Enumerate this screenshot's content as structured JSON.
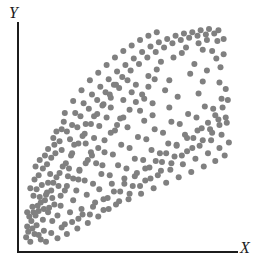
{
  "figure": {
    "width": 262,
    "height": 267,
    "background_color": "#ffffff"
  },
  "axes": {
    "y_label": "Y",
    "x_label": "X",
    "axis_color": "#1c1c1c",
    "origin_px": [
      17,
      252
    ],
    "y_axis_top_px": 22,
    "x_axis_right_px": 238
  },
  "chart_data": {
    "type": "scatter",
    "title": "",
    "subtitle": "",
    "xlabel": "X",
    "ylabel": "Y",
    "xlim": [
      0,
      100
    ],
    "ylim": [
      0,
      100
    ],
    "grid": false,
    "legend": null,
    "annotations": [],
    "marker": {
      "shape": "circle",
      "color": "#808080",
      "diameter_px": 6
    },
    "n_points": 304,
    "points": [
      [
        3.5,
        2.0
      ],
      [
        5.5,
        5.5
      ],
      [
        8.5,
        3.0
      ],
      [
        2.5,
        6.5
      ],
      [
        11.0,
        2.0
      ],
      [
        6.5,
        9.5
      ],
      [
        13.5,
        6.0
      ],
      [
        9.5,
        12.0
      ],
      [
        16.5,
        3.5
      ],
      [
        4.0,
        11.5
      ],
      [
        18.5,
        8.5
      ],
      [
        12.0,
        15.5
      ],
      [
        21.0,
        5.5
      ],
      [
        7.5,
        16.0
      ],
      [
        23.5,
        11.0
      ],
      [
        15.0,
        19.0
      ],
      [
        26.0,
        8.0
      ],
      [
        10.5,
        21.0
      ],
      [
        28.5,
        14.5
      ],
      [
        18.0,
        23.0
      ],
      [
        31.0,
        10.5
      ],
      [
        13.5,
        25.5
      ],
      [
        33.5,
        18.0
      ],
      [
        21.0,
        27.5
      ],
      [
        36.0,
        13.5
      ],
      [
        5.0,
        15.5
      ],
      [
        38.5,
        21.5
      ],
      [
        24.0,
        31.0
      ],
      [
        41.0,
        17.0
      ],
      [
        8.5,
        20.0
      ],
      [
        43.5,
        25.0
      ],
      [
        27.0,
        34.5
      ],
      [
        46.0,
        20.5
      ],
      [
        11.5,
        24.5
      ],
      [
        48.5,
        28.5
      ],
      [
        30.0,
        38.0
      ],
      [
        51.0,
        24.0
      ],
      [
        14.5,
        29.0
      ],
      [
        53.5,
        32.0
      ],
      [
        33.0,
        41.5
      ],
      [
        56.0,
        27.5
      ],
      [
        17.5,
        33.5
      ],
      [
        58.5,
        35.5
      ],
      [
        36.0,
        45.0
      ],
      [
        61.0,
        31.0
      ],
      [
        20.5,
        38.0
      ],
      [
        63.5,
        39.0
      ],
      [
        39.0,
        48.5
      ],
      [
        66.0,
        34.5
      ],
      [
        23.5,
        42.5
      ],
      [
        68.5,
        42.5
      ],
      [
        42.0,
        52.0
      ],
      [
        71.0,
        38.0
      ],
      [
        26.5,
        47.0
      ],
      [
        73.5,
        46.0
      ],
      [
        45.0,
        55.5
      ],
      [
        76.0,
        41.5
      ],
      [
        29.5,
        51.5
      ],
      [
        78.5,
        49.5
      ],
      [
        48.0,
        59.0
      ],
      [
        81.0,
        45.0
      ],
      [
        32.5,
        56.0
      ],
      [
        83.5,
        53.0
      ],
      [
        51.0,
        62.5
      ],
      [
        86.0,
        48.5
      ],
      [
        35.5,
        60.5
      ],
      [
        88.5,
        56.5
      ],
      [
        54.0,
        66.0
      ],
      [
        90.5,
        52.0
      ],
      [
        38.5,
        65.0
      ],
      [
        92.0,
        60.0
      ],
      [
        57.0,
        69.5
      ],
      [
        94.0,
        55.5
      ],
      [
        41.5,
        69.5
      ],
      [
        95.5,
        63.5
      ],
      [
        60.0,
        73.0
      ],
      [
        97.0,
        59.0
      ],
      [
        44.5,
        74.0
      ],
      [
        98.0,
        67.0
      ],
      [
        63.0,
        76.5
      ],
      [
        2.0,
        9.0
      ],
      [
        6.0,
        14.0
      ],
      [
        10.0,
        7.0
      ],
      [
        14.0,
        11.5
      ],
      [
        4.5,
        18.0
      ],
      [
        8.0,
        22.5
      ],
      [
        12.5,
        17.5
      ],
      [
        16.5,
        14.0
      ],
      [
        20.0,
        10.0
      ],
      [
        18.0,
        18.5
      ],
      [
        22.5,
        15.5
      ],
      [
        26.5,
        12.5
      ],
      [
        24.0,
        21.0
      ],
      [
        28.0,
        17.0
      ],
      [
        32.0,
        14.5
      ],
      [
        30.5,
        23.5
      ],
      [
        34.5,
        20.0
      ],
      [
        38.5,
        16.5
      ],
      [
        36.5,
        26.0
      ],
      [
        40.5,
        22.0
      ],
      [
        44.5,
        19.0
      ],
      [
        42.5,
        28.5
      ],
      [
        46.5,
        25.0
      ],
      [
        50.5,
        21.5
      ],
      [
        48.5,
        31.0
      ],
      [
        52.5,
        27.5
      ],
      [
        56.5,
        24.0
      ],
      [
        54.5,
        33.5
      ],
      [
        58.5,
        30.0
      ],
      [
        62.5,
        26.5
      ],
      [
        60.5,
        36.0
      ],
      [
        64.5,
        32.5
      ],
      [
        68.5,
        29.0
      ],
      [
        66.5,
        38.5
      ],
      [
        70.5,
        35.0
      ],
      [
        74.5,
        31.5
      ],
      [
        72.5,
        41.0
      ],
      [
        76.5,
        37.5
      ],
      [
        80.5,
        34.0
      ],
      [
        78.5,
        43.5
      ],
      [
        82.5,
        40.0
      ],
      [
        86.5,
        36.5
      ],
      [
        84.5,
        46.0
      ],
      [
        88.5,
        42.5
      ],
      [
        92.0,
        39.0
      ],
      [
        90.0,
        48.5
      ],
      [
        94.0,
        45.0
      ],
      [
        96.5,
        41.5
      ],
      [
        95.0,
        51.0
      ],
      [
        98.5,
        47.5
      ],
      [
        3.0,
        13.5
      ],
      [
        7.0,
        18.5
      ],
      [
        11.0,
        23.5
      ],
      [
        5.0,
        23.0
      ],
      [
        9.0,
        28.0
      ],
      [
        13.0,
        33.0
      ],
      [
        7.5,
        32.5
      ],
      [
        11.5,
        37.5
      ],
      [
        15.5,
        42.5
      ],
      [
        17.0,
        27.5
      ],
      [
        21.5,
        32.0
      ],
      [
        19.0,
        36.5
      ],
      [
        23.0,
        41.5
      ],
      [
        25.5,
        25.5
      ],
      [
        29.5,
        30.0
      ],
      [
        27.0,
        35.0
      ],
      [
        31.0,
        39.5
      ],
      [
        33.5,
        28.5
      ],
      [
        37.5,
        33.0
      ],
      [
        35.0,
        38.0
      ],
      [
        39.0,
        43.0
      ],
      [
        41.5,
        32.5
      ],
      [
        45.5,
        37.0
      ],
      [
        43.0,
        42.0
      ],
      [
        47.0,
        46.5
      ],
      [
        49.5,
        35.5
      ],
      [
        53.5,
        40.0
      ],
      [
        51.0,
        45.0
      ],
      [
        55.0,
        50.0
      ],
      [
        57.5,
        39.5
      ],
      [
        61.5,
        44.0
      ],
      [
        59.0,
        49.0
      ],
      [
        63.0,
        53.5
      ],
      [
        65.5,
        42.5
      ],
      [
        69.5,
        47.0
      ],
      [
        67.0,
        52.0
      ],
      [
        71.0,
        57.0
      ],
      [
        73.5,
        46.5
      ],
      [
        77.5,
        51.0
      ],
      [
        75.0,
        56.0
      ],
      [
        79.0,
        60.5
      ],
      [
        81.5,
        49.5
      ],
      [
        85.5,
        54.0
      ],
      [
        83.0,
        59.0
      ],
      [
        87.0,
        64.0
      ],
      [
        89.5,
        53.5
      ],
      [
        93.5,
        58.0
      ],
      [
        91.0,
        63.0
      ],
      [
        95.0,
        67.5
      ],
      [
        97.5,
        56.5
      ],
      [
        1.5,
        4.0
      ],
      [
        4.5,
        8.0
      ],
      [
        7.5,
        5.0
      ],
      [
        2.0,
        15.5
      ],
      [
        6.5,
        26.0
      ],
      [
        10.0,
        17.0
      ],
      [
        14.0,
        22.0
      ],
      [
        16.0,
        31.5
      ],
      [
        12.0,
        29.0
      ],
      [
        20.0,
        25.5
      ],
      [
        18.5,
        44.0
      ],
      [
        22.0,
        35.5
      ],
      [
        24.5,
        46.5
      ],
      [
        26.5,
        30.5
      ],
      [
        28.5,
        50.5
      ],
      [
        32.5,
        43.0
      ],
      [
        30.0,
        56.0
      ],
      [
        34.0,
        49.5
      ],
      [
        36.5,
        55.0
      ],
      [
        38.0,
        37.0
      ],
      [
        40.0,
        59.0
      ],
      [
        44.0,
        53.0
      ],
      [
        42.0,
        63.5
      ],
      [
        46.5,
        58.5
      ],
      [
        48.0,
        67.0
      ],
      [
        50.0,
        54.5
      ],
      [
        52.0,
        70.5
      ],
      [
        56.0,
        62.0
      ],
      [
        54.0,
        74.0
      ],
      [
        58.0,
        67.5
      ],
      [
        60.0,
        78.0
      ],
      [
        62.0,
        60.0
      ],
      [
        64.0,
        81.0
      ],
      [
        68.0,
        71.5
      ],
      [
        66.0,
        84.5
      ],
      [
        70.0,
        76.0
      ],
      [
        72.0,
        86.5
      ],
      [
        74.0,
        68.5
      ],
      [
        76.0,
        88.5
      ],
      [
        80.0,
        79.0
      ],
      [
        78.0,
        91.0
      ],
      [
        82.0,
        83.5
      ],
      [
        84.0,
        93.0
      ],
      [
        86.0,
        75.5
      ],
      [
        88.0,
        94.5
      ],
      [
        92.5,
        86.0
      ],
      [
        90.5,
        89.5
      ],
      [
        94.5,
        82.0
      ],
      [
        96.0,
        88.0
      ],
      [
        93.0,
        94.0
      ],
      [
        5.5,
        30.5
      ],
      [
        9.5,
        35.5
      ],
      [
        3.5,
        26.5
      ],
      [
        13.5,
        40.5
      ],
      [
        17.5,
        48.0
      ],
      [
        21.0,
        52.5
      ],
      [
        15.0,
        46.5
      ],
      [
        19.5,
        57.0
      ],
      [
        23.5,
        55.5
      ],
      [
        25.0,
        61.0
      ],
      [
        27.5,
        59.5
      ],
      [
        29.0,
        65.5
      ],
      [
        31.5,
        63.0
      ],
      [
        33.0,
        69.5
      ],
      [
        35.5,
        67.0
      ],
      [
        37.0,
        73.0
      ],
      [
        39.5,
        70.5
      ],
      [
        41.0,
        76.5
      ],
      [
        43.5,
        74.0
      ],
      [
        45.0,
        80.0
      ],
      [
        47.5,
        77.5
      ],
      [
        49.0,
        83.0
      ],
      [
        51.5,
        80.5
      ],
      [
        53.0,
        86.0
      ],
      [
        55.5,
        83.5
      ],
      [
        57.0,
        89.0
      ],
      [
        59.5,
        86.5
      ],
      [
        61.0,
        91.5
      ],
      [
        63.5,
        89.0
      ],
      [
        65.0,
        93.5
      ],
      [
        67.5,
        91.0
      ],
      [
        69.0,
        95.0
      ],
      [
        71.5,
        93.0
      ],
      [
        73.0,
        96.5
      ],
      [
        75.5,
        94.5
      ],
      [
        77.0,
        97.5
      ],
      [
        79.5,
        95.5
      ],
      [
        81.0,
        98.0
      ],
      [
        83.5,
        96.5
      ],
      [
        85.0,
        99.0
      ],
      [
        87.5,
        97.0
      ],
      [
        89.0,
        99.5
      ],
      [
        91.5,
        97.5
      ],
      [
        93.5,
        99.0
      ],
      [
        96.0,
        95.0
      ],
      [
        8.0,
        39.5
      ],
      [
        12.0,
        44.5
      ],
      [
        16.0,
        52.5
      ],
      [
        20.0,
        61.0
      ],
      [
        24.0,
        66.5
      ],
      [
        28.0,
        71.5
      ],
      [
        32.0,
        76.0
      ],
      [
        36.0,
        79.5
      ],
      [
        40.0,
        83.0
      ],
      [
        44.0,
        86.5
      ],
      [
        48.0,
        89.5
      ],
      [
        52.0,
        92.0
      ],
      [
        56.0,
        94.5
      ],
      [
        60.0,
        96.5
      ],
      [
        64.0,
        98.0
      ],
      [
        6.0,
        36.5
      ],
      [
        10.5,
        41.5
      ],
      [
        14.5,
        49.5
      ],
      [
        18.5,
        53.5
      ],
      [
        22.5,
        49.0
      ],
      [
        26.0,
        54.5
      ],
      [
        34.0,
        59.5
      ],
      [
        30.0,
        47.0
      ],
      [
        38.0,
        64.5
      ],
      [
        42.0,
        68.0
      ],
      [
        46.0,
        72.5
      ],
      [
        50.0,
        76.0
      ],
      [
        58.0,
        57.5
      ],
      [
        62.0,
        65.5
      ],
      [
        70.0,
        63.5
      ],
      [
        86.0,
        90.0
      ],
      [
        94.0,
        75.0
      ],
      [
        97.0,
        72.0
      ],
      [
        88.0,
        80.5
      ],
      [
        84.0,
        70.0
      ]
    ]
  }
}
